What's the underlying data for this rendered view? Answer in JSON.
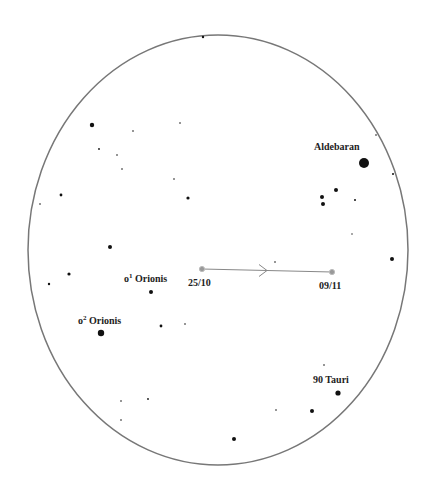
{
  "chart_meta": {
    "field_of_view": {
      "cx": 218,
      "cy": 250,
      "rx": 190,
      "ry": 215,
      "stroke": "#777777"
    }
  },
  "labels": {
    "aldebaran": "Aldebaran",
    "o1_orionis_prefix": "o",
    "o1_orionis_sup": "1",
    "o1_orionis_name": " Orionis",
    "o2_orionis_prefix": "o",
    "o2_orionis_sup": "2",
    "o2_orionis_name": " Orionis",
    "tauri_90": "90 Tauri",
    "date_start": "25/10",
    "date_end": "09/11"
  },
  "track": {
    "start": {
      "x": 202,
      "y": 269,
      "date": "25/10"
    },
    "end": {
      "x": 332,
      "y": 272,
      "date": "09/11"
    },
    "color": "#888888"
  },
  "stars": [
    {
      "x": 203,
      "y": 37,
      "r": 1.2
    },
    {
      "x": 92,
      "y": 125,
      "r": 2.2
    },
    {
      "x": 133,
      "y": 131,
      "r": 0.8
    },
    {
      "x": 180,
      "y": 123,
      "r": 0.8
    },
    {
      "x": 99,
      "y": 149,
      "r": 0.9
    },
    {
      "x": 117,
      "y": 155,
      "r": 0.8
    },
    {
      "x": 122,
      "y": 169,
      "r": 0.8
    },
    {
      "x": 61,
      "y": 195,
      "r": 1.4
    },
    {
      "x": 40,
      "y": 204,
      "r": 0.8
    },
    {
      "x": 174,
      "y": 179,
      "r": 0.8
    },
    {
      "x": 188,
      "y": 198,
      "r": 1.6
    },
    {
      "x": 110,
      "y": 247,
      "r": 2.0
    },
    {
      "x": 69,
      "y": 274,
      "r": 1.6
    },
    {
      "x": 49,
      "y": 284,
      "r": 1.2
    },
    {
      "x": 151,
      "y": 292,
      "r": 2.0
    },
    {
      "x": 161,
      "y": 326,
      "r": 1.4
    },
    {
      "x": 185,
      "y": 324,
      "r": 0.8
    },
    {
      "x": 101,
      "y": 333,
      "r": 3.2
    },
    {
      "x": 364,
      "y": 163,
      "r": 5.0
    },
    {
      "x": 376,
      "y": 135,
      "r": 0.8
    },
    {
      "x": 393,
      "y": 174,
      "r": 1.0
    },
    {
      "x": 336,
      "y": 190,
      "r": 2.0
    },
    {
      "x": 322,
      "y": 197,
      "r": 2.0
    },
    {
      "x": 323,
      "y": 204,
      "r": 2.0
    },
    {
      "x": 355,
      "y": 200,
      "r": 1.0
    },
    {
      "x": 352,
      "y": 234,
      "r": 0.7
    },
    {
      "x": 392,
      "y": 259,
      "r": 2.0
    },
    {
      "x": 275,
      "y": 262,
      "r": 0.8
    },
    {
      "x": 324,
      "y": 365,
      "r": 0.8
    },
    {
      "x": 338,
      "y": 393,
      "r": 2.6
    },
    {
      "x": 312,
      "y": 411,
      "r": 2.0
    },
    {
      "x": 276,
      "y": 410,
      "r": 0.8
    },
    {
      "x": 121,
      "y": 401,
      "r": 0.8
    },
    {
      "x": 148,
      "y": 399,
      "r": 0.9
    },
    {
      "x": 121,
      "y": 420,
      "r": 0.8
    },
    {
      "x": 234,
      "y": 439,
      "r": 2.0
    }
  ]
}
